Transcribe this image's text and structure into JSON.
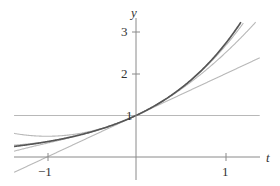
{
  "chart_data": {
    "type": "line",
    "title": "",
    "xlabel": "t",
    "ylabel": "y",
    "xlim": [
      -1.37,
      1.39
    ],
    "ylim": [
      -0.45,
      3.25
    ],
    "x_ticks": [
      -1,
      1
    ],
    "y_ticks": [
      1,
      2,
      3
    ],
    "x_tick_labels": [
      "−1",
      "1"
    ],
    "y_tick_labels": [
      "1",
      "2",
      "3"
    ],
    "grid": false,
    "legend": null,
    "series": [
      {
        "name": "e^t",
        "expr": "exp",
        "color": "#555555",
        "width": 1.6
      },
      {
        "name": "P0(t) = 1",
        "degree": 0,
        "color": "#b8b8b8",
        "width": 1.1
      },
      {
        "name": "P1(t) = 1 + t",
        "degree": 1,
        "color": "#b8b8b8",
        "width": 1.1
      },
      {
        "name": "P2(t) = 1 + t + t^2/2",
        "degree": 2,
        "color": "#b8b8b8",
        "width": 1.1
      },
      {
        "name": "P3(t)",
        "degree": 3,
        "color": "#b8b8b8",
        "width": 1.1
      },
      {
        "name": "P4(t)",
        "degree": 4,
        "color": "#b8b8b8",
        "width": 1.1
      }
    ]
  },
  "axes": {
    "x_name": "t",
    "y_name": "y",
    "tick_neg1": "−1",
    "tick_pos1": "1",
    "tick_y1": "1",
    "tick_y2": "2",
    "tick_y3": "3"
  },
  "colors": {
    "axis": "#8a8a8a",
    "exact": "#555555",
    "approx": "#b8b8b8"
  }
}
